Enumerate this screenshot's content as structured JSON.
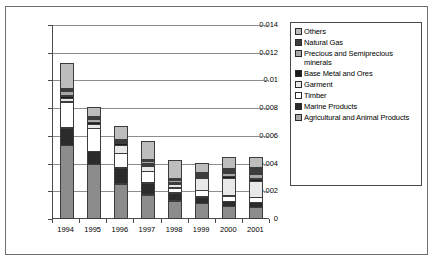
{
  "chart_data": {
    "type": "bar",
    "subtype": "stacked-bar",
    "title": "",
    "xlabel": "",
    "ylabel": "",
    "categories": [
      "1994",
      "1995",
      "1996",
      "1997",
      "1998",
      "1999",
      "2000",
      "2001"
    ],
    "ylim": [
      0,
      0.014
    ],
    "ytick_labels": [
      "0",
      "0.002",
      "0.004",
      "0.006",
      "0.008",
      "0.01",
      "0.012",
      "0.014"
    ],
    "ytick_values": [
      0,
      0.002,
      0.004,
      0.006,
      0.008,
      0.01,
      0.012,
      0.014
    ],
    "grid": true,
    "grid_axis": "y",
    "legend_position": "right",
    "stack_order_bottom_to_top": [
      "Agricultural and Animal Products",
      "Marine Products",
      "Timber",
      "Garment",
      "Base Metal and Ores",
      "Precious and Semiprecious minerals",
      "Natural Gas",
      "Others"
    ],
    "series": [
      {
        "name": "Agricultural and Animal Products",
        "color": "#8c8c8c",
        "values": [
          0.0053,
          0.0039,
          0.0025,
          0.0017,
          0.0013,
          0.0011,
          0.0009,
          0.0008
        ]
      },
      {
        "name": "Marine Products",
        "color": "#2b2b2b",
        "values": [
          0.0013,
          0.001,
          0.0012,
          0.0009,
          0.0006,
          0.0005,
          0.0004,
          0.0004
        ]
      },
      {
        "name": "Timber",
        "color": "#ffffff",
        "values": [
          0.0019,
          0.0017,
          0.0011,
          0.0009,
          0.0004,
          0.0005,
          0.0004,
          0.0004
        ]
      },
      {
        "name": "Garment",
        "color": "#e8e8e8",
        "values": [
          0.0003,
          0.0003,
          0.0006,
          0.0004,
          0.0003,
          0.0009,
          0.0013,
          0.0012
        ]
      },
      {
        "name": "Base Metal and Ores",
        "color": "#1a1a1a",
        "values": [
          0.0002,
          0.0002,
          0.0002,
          0.0002,
          0.0001,
          0.0001,
          0.0002,
          0.0002
        ]
      },
      {
        "name": "Precious and Semiprecious minerals",
        "color": "#a8a8a8",
        "values": [
          0.0004,
          0.0003,
          0.0002,
          0.0002,
          0.0002,
          0.0002,
          0.0003,
          0.0004
        ]
      },
      {
        "name": "Natural Gas",
        "color": "#3d3d3d",
        "values": [
          0.0002,
          0.0002,
          0.0001,
          0.0001,
          0.0001,
          0.0002,
          0.0003,
          0.0005
        ]
      },
      {
        "name": "Others",
        "color": "#bdbdbd",
        "values": [
          0.0019,
          0.0007,
          0.001,
          0.0014,
          0.0014,
          0.0007,
          0.0009,
          0.0008
        ]
      }
    ],
    "totals": [
      0.01147,
      0.00833,
      0.00697,
      0.00585,
      0.00425,
      0.0042,
      0.00465,
      0.00463
    ]
  },
  "legend": {
    "items": [
      {
        "label": "Others",
        "color": "#bdbdbd"
      },
      {
        "label": "Natural Gas",
        "color": "#3d3d3d"
      },
      {
        "label": "Precious and Semiprecious minerals",
        "color": "#a8a8a8"
      },
      {
        "label": "Base Metal and Ores",
        "color": "#1a1a1a"
      },
      {
        "label": "Garment",
        "color": "#e8e8e8"
      },
      {
        "label": "Timber",
        "color": "#ffffff"
      },
      {
        "label": "Marine Products",
        "color": "#2b2b2b"
      },
      {
        "label": "Agricultural and Animal Products",
        "color": "#a8a8a8"
      }
    ]
  }
}
